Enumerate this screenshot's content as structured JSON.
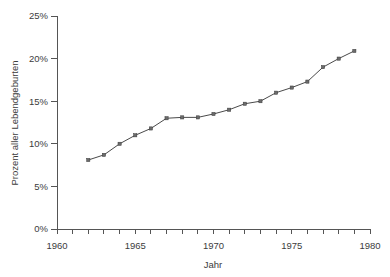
{
  "chart_data": {
    "type": "line",
    "title": "",
    "subtitle": "",
    "xlabel": "Jahr",
    "ylabel": "Prozent aller Lebendgeburten",
    "xlim": [
      1960,
      1980
    ],
    "ylim": [
      0,
      25
    ],
    "grid": false,
    "legend": null,
    "x_tick_labels": [
      "1960",
      "1965",
      "1970",
      "1975",
      "1980"
    ],
    "x_tick_values": [
      1960,
      1965,
      1970,
      1975,
      1980
    ],
    "x_minor_tick_values": [
      1961,
      1962,
      1963,
      1964,
      1966,
      1967,
      1968,
      1969,
      1971,
      1972,
      1973,
      1974,
      1976,
      1977,
      1978,
      1979
    ],
    "y_tick_labels": [
      "0%",
      "5%",
      "10%",
      "15%",
      "20%",
      "25%"
    ],
    "y_tick_values": [
      0,
      5,
      10,
      15,
      20,
      25
    ],
    "series": [
      {
        "name": "Prozent aller Lebendgeburten",
        "marker": "square",
        "color": "#4a4a4a",
        "x": [
          1962,
          1963,
          1964,
          1965,
          1966,
          1967,
          1968,
          1969,
          1970,
          1971,
          1972,
          1973,
          1974,
          1975,
          1976,
          1977,
          1978,
          1979
        ],
        "values": [
          8.1,
          8.7,
          10.0,
          11.0,
          11.8,
          13.0,
          13.1,
          13.1,
          13.5,
          14.0,
          14.7,
          15.0,
          16.0,
          16.6,
          17.3,
          19.0,
          20.0,
          20.9
        ]
      }
    ]
  },
  "axes": {
    "y_axis_label": "Prozent aller Lebendgeburten",
    "x_axis_label": "Jahr"
  },
  "colors": {
    "line": "#4a4a4a",
    "marker_fill": "#6b6b6b",
    "axis": "#555555",
    "text": "#3c3c3c",
    "background": "#ffffff"
  }
}
